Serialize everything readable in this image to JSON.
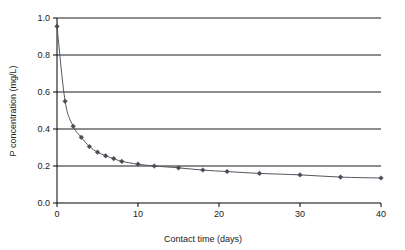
{
  "chart_data": {
    "type": "line",
    "title": "",
    "subtitle": "",
    "xlabel": "Contact time (days)",
    "ylabel": "P concentration (mg/L)",
    "xlim": [
      0,
      40
    ],
    "ylim": [
      0,
      1.0
    ],
    "xticks": [
      0,
      10,
      20,
      30,
      40
    ],
    "xtick_labels": [
      "0",
      "10",
      "20",
      "30",
      "40"
    ],
    "yticks": [
      0.0,
      0.2,
      0.4,
      0.6,
      0.8,
      1.0
    ],
    "ytick_labels": [
      "0.0",
      "0.2",
      "0.4",
      "0.6",
      "0.8",
      "1.0"
    ],
    "grid": "horizontal",
    "legend": null,
    "legend_position": "none",
    "marker": "diamond",
    "marker_color": "#4a4a55",
    "line_color": "#555560",
    "grid_color": "#000000",
    "axis_color": "#000000",
    "series": [
      {
        "name": "P concentration",
        "x": [
          0,
          1,
          2,
          3,
          4,
          5,
          6,
          7,
          8,
          10,
          12,
          15,
          18,
          21,
          25,
          30,
          35,
          40
        ],
        "values": [
          0.955,
          0.55,
          0.415,
          0.355,
          0.305,
          0.275,
          0.255,
          0.24,
          0.225,
          0.21,
          0.2,
          0.19,
          0.178,
          0.17,
          0.16,
          0.152,
          0.14,
          0.135
        ]
      }
    ]
  }
}
